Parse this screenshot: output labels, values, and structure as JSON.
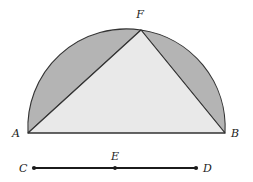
{
  "figure": {
    "background_color": "#ffffff",
    "stroke_color": "#333333",
    "triangle_fill": "#e9e9e9",
    "lune_fill": "#b4b4b4",
    "segment_color": "#1b1b1b",
    "labels": {
      "a": "A",
      "b": "B",
      "f": "F",
      "c": "C",
      "d": "D",
      "e": "E"
    },
    "points": {
      "A": {
        "x": 28,
        "y": 133
      },
      "B": {
        "x": 225,
        "y": 133
      },
      "F": {
        "x": 141,
        "y": 30
      },
      "C": {
        "x": 34,
        "y": 168
      },
      "D": {
        "x": 196,
        "y": 168
      },
      "E": {
        "x": 115,
        "y": 168
      }
    },
    "label_positions": {
      "A": {
        "x": 12,
        "y": 137
      },
      "B": {
        "x": 231,
        "y": 137
      },
      "F": {
        "x": 136,
        "y": 18
      },
      "C": {
        "x": 19,
        "y": 172
      },
      "D": {
        "x": 203,
        "y": 172
      },
      "E": {
        "x": 111,
        "y": 160
      }
    },
    "arc": {
      "center_x": 126.5,
      "center_y": 133,
      "radius": 98.5,
      "start_angle_deg": 180,
      "end_angle_deg": 0
    }
  }
}
